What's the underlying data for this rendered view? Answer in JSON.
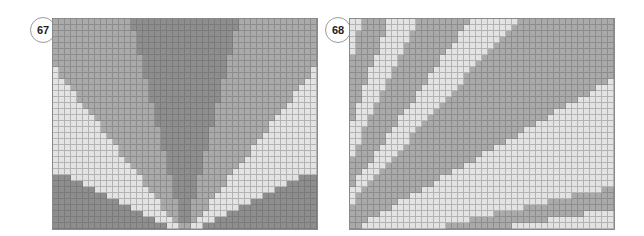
{
  "colors": {
    "dark": "#8e8e8e",
    "medium": "#aaaaaa",
    "light": "#e3e3e3"
  },
  "panels": [
    {
      "label": "67",
      "badge": {
        "x": 30,
        "y": 17
      },
      "grid": {
        "x": 52,
        "y": 18,
        "cols": 44,
        "rows": 35,
        "cell": 6
      },
      "pattern": {
        "type": "fan-vertical",
        "origin": {
          "col": 22,
          "row": 36
        },
        "bands_deg": [
          {
            "max": 14,
            "tone": "dark"
          },
          {
            "max": 38,
            "tone": "medium"
          },
          {
            "max": 64,
            "tone": "light"
          },
          {
            "max": 90,
            "tone": "dark"
          }
        ]
      }
    },
    {
      "label": "68",
      "badge": {
        "x": 325,
        "y": 17
      },
      "grid": {
        "x": 349,
        "y": 18,
        "cols": 44,
        "rows": 35,
        "cell": 6
      },
      "pattern": {
        "type": "fan-horizontal",
        "origin": {
          "col": -8,
          "row": 40
        },
        "bands_deg": [
          {
            "max": 9,
            "tone": "light"
          },
          {
            "max": 13,
            "tone": "medium"
          },
          {
            "max": 30,
            "tone": "light"
          },
          {
            "max": 48,
            "tone": "medium"
          },
          {
            "max": 55,
            "tone": "light"
          },
          {
            "max": 64,
            "tone": "medium"
          },
          {
            "max": 70,
            "tone": "light"
          },
          {
            "max": 76,
            "tone": "medium"
          },
          {
            "max": 80,
            "tone": "light"
          },
          {
            "max": 90,
            "tone": "medium"
          }
        ]
      }
    }
  ]
}
